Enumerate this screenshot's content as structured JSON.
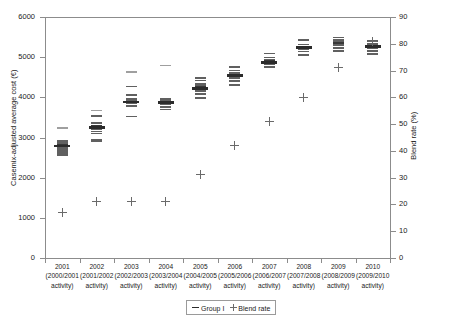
{
  "chart_data": {
    "type": "scatter",
    "title": "",
    "xlabel": "",
    "ylabel": "Casemix-adjusted average cost (€)",
    "y2label": "Blend rate (%)",
    "ylim": [
      0,
      6000
    ],
    "y2lim": [
      0,
      90
    ],
    "yticks": [
      "0",
      "1000",
      "2000",
      "3000",
      "4000",
      "5000",
      "6000"
    ],
    "y2ticks": [
      "0",
      "10",
      "20",
      "30",
      "40",
      "50",
      "60",
      "70",
      "80",
      "90"
    ],
    "grid": false,
    "legend_position": "bottom-center",
    "legend": [
      {
        "marker": "dash",
        "label": "Group I"
      },
      {
        "marker": "plus",
        "label": "Blend rate"
      }
    ],
    "categories": [
      {
        "year": "2001",
        "period": "(2000/2001",
        "activity": "activity)"
      },
      {
        "year": "2002",
        "period": "(2001/2002",
        "activity": "activity)"
      },
      {
        "year": "2003",
        "period": "(2002/2003",
        "activity": "activity)"
      },
      {
        "year": "2004",
        "period": "(2003/2004",
        "activity": "activity)"
      },
      {
        "year": "2005",
        "period": "(2004/2005",
        "activity": "activity)"
      },
      {
        "year": "2006",
        "period": "(2005/2006",
        "activity": "activity)"
      },
      {
        "year": "2007",
        "period": "(2006/2007",
        "activity": "activity)"
      },
      {
        "year": "2008",
        "period": "(2007/2008",
        "activity": "activity)"
      },
      {
        "year": "2009",
        "period": "(2008/2009",
        "activity": "activity)"
      },
      {
        "year": "2010",
        "period": "(2009/2010",
        "activity": "activity)"
      }
    ],
    "series": [
      {
        "name": "Group I",
        "marker": "dash",
        "axis": "left",
        "unit": "€",
        "points_per_category": [
          [
            2570,
            2620,
            2670,
            2700,
            2740,
            2780,
            2800,
            2810,
            2830,
            2870,
            2920,
            3230
          ],
          [
            2910,
            2950,
            3100,
            3150,
            3200,
            3240,
            3260,
            3280,
            3300,
            3360,
            3530,
            3670
          ],
          [
            3520,
            3790,
            3850,
            3880,
            3900,
            3920,
            3960,
            4060,
            4270,
            4630
          ],
          [
            3700,
            3760,
            3820,
            3860,
            3890,
            3900,
            3920,
            3960,
            4790
          ],
          [
            3980,
            4080,
            4160,
            4200,
            4230,
            4250,
            4280,
            4330,
            4420,
            4480
          ],
          [
            4310,
            4400,
            4480,
            4530,
            4560,
            4580,
            4620,
            4670,
            4760
          ],
          [
            4750,
            4820,
            4860,
            4880,
            4900,
            4930,
            4990,
            5090
          ],
          [
            5050,
            5140,
            5190,
            5220,
            5250,
            5270,
            5320,
            5420
          ],
          [
            5150,
            5230,
            5290,
            5330,
            5360,
            5380,
            5420,
            5490
          ],
          [
            5080,
            5160,
            5220,
            5250,
            5280,
            5300,
            5340,
            5400
          ]
        ],
        "medians": [
          2800,
          3260,
          3900,
          3890,
          4230,
          4560,
          4880,
          5250,
          5340,
          5280
        ]
      },
      {
        "name": "Blend rate",
        "marker": "plus",
        "axis": "right",
        "unit": "%",
        "values": [
          17,
          21,
          21,
          21,
          31,
          42,
          51,
          60,
          71,
          81
        ]
      }
    ]
  }
}
